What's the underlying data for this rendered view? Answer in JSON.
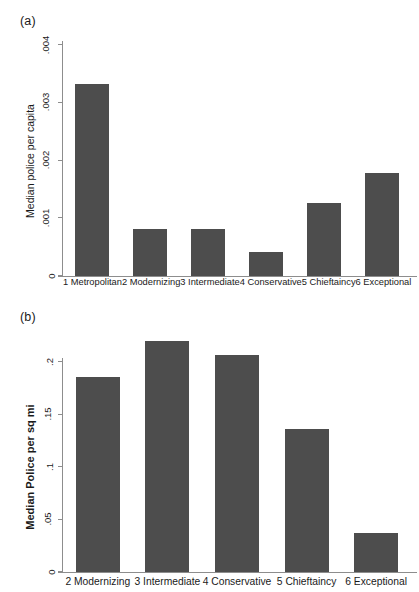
{
  "figure": {
    "panels": [
      {
        "tag": "(a)",
        "chart_data": {
          "type": "bar",
          "title": "",
          "xlabel": "",
          "ylabel": "Median police per capita",
          "ylim": [
            0,
            0.004
          ],
          "yticks": [
            0,
            0.001,
            0.002,
            0.003,
            0.004
          ],
          "ytick_labels": [
            "0",
            ".001",
            ".002",
            ".003",
            ".004"
          ],
          "grid": false,
          "legend": null,
          "bar_color": "#4d4d4d",
          "categories": [
            "1 Metropolitan",
            "2 Modernizing",
            "3 Intermediate",
            "4 Conservative",
            "5 Chieftaincy",
            "6 Exceptional"
          ],
          "values": [
            0.00332,
            0.00081,
            0.00082,
            0.00042,
            0.00126,
            0.00178
          ]
        }
      },
      {
        "tag": "(b)",
        "chart_data": {
          "type": "bar",
          "title": "",
          "xlabel": "",
          "ylabel": "Median Police per sq mi",
          "ylim": [
            0,
            0.2
          ],
          "yticks": [
            0,
            0.05,
            0.1,
            0.15,
            0.2
          ],
          "ytick_labels": [
            "0",
            ".05",
            ".1",
            ".15",
            ".2"
          ],
          "grid": false,
          "legend": null,
          "bar_color": "#4d4d4d",
          "categories": [
            "2 Modernizing",
            "3 Intermediate",
            "4 Conservative",
            "5 Chieftaincy",
            "6 Exceptional"
          ],
          "values": [
            0.186,
            0.22,
            0.207,
            0.136,
            0.037
          ]
        }
      }
    ]
  }
}
